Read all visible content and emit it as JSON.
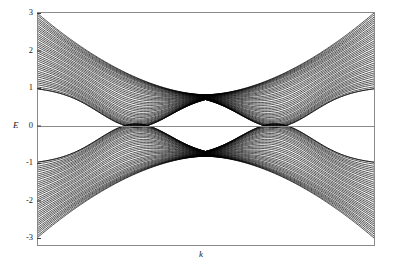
{
  "figure": {
    "background_color": "#ffffff",
    "frame_color": "#8a8a8a",
    "curve_color": "#000000",
    "width": 393,
    "height": 275
  },
  "axes": {
    "x_label": "k",
    "y_label": "E",
    "y_ticks": [
      "3",
      "2",
      "1",
      "0",
      "-1",
      "-2",
      "-3"
    ],
    "x_ticks": []
  },
  "chart_data": {
    "type": "line",
    "title": "",
    "xlabel": "k",
    "ylabel": "E",
    "xlim": [
      -1,
      1
    ],
    "ylim": [
      -3,
      3
    ],
    "grid": false,
    "legend_position": "none",
    "n_subbands": 40,
    "crossing_points": [
      {
        "k": 0.0,
        "E": 0.82
      },
      {
        "k": 0.0,
        "E": -0.82
      }
    ],
    "band_edges": {
      "upper_manifold_top_at_edge": 3.0,
      "upper_manifold_bottom_at_edge": 1.0,
      "upper_manifold_min": 0.02,
      "lower_manifold_bottom_at_edge": -3.0,
      "lower_manifold_top_at_edge": -1.0,
      "lower_manifold_max": -0.02
    },
    "series": [
      {
        "name": "subband-1",
        "E_edge": 3.0,
        "E_center": 0.82
      },
      {
        "name": "subband-2",
        "E_edge": 2.95,
        "E_center": 0.82
      },
      {
        "name": "subband-3",
        "E_edge": 2.89,
        "E_center": 0.82
      },
      {
        "name": "subband-4",
        "E_edge": 2.84,
        "E_center": 0.82
      },
      {
        "name": "subband-5",
        "E_edge": 2.79,
        "E_center": 0.82
      },
      {
        "name": "subband-6",
        "E_edge": 2.74,
        "E_center": 0.82
      },
      {
        "name": "subband-7",
        "E_edge": 2.68,
        "E_center": 0.82
      },
      {
        "name": "subband-8",
        "E_edge": 2.63,
        "E_center": 0.82
      },
      {
        "name": "subband-9",
        "E_edge": 2.58,
        "E_center": 0.82
      },
      {
        "name": "subband-10",
        "E_edge": 2.53,
        "E_center": 0.82
      },
      {
        "name": "subband-11",
        "E_edge": 2.47,
        "E_center": 0.82
      },
      {
        "name": "subband-12",
        "E_edge": 2.42,
        "E_center": 0.82
      },
      {
        "name": "subband-13",
        "E_edge": 2.37,
        "E_center": 0.82
      },
      {
        "name": "subband-14",
        "E_edge": 2.32,
        "E_center": 0.82
      },
      {
        "name": "subband-15",
        "E_edge": 2.26,
        "E_center": 0.82
      },
      {
        "name": "subband-16",
        "E_edge": 2.21,
        "E_center": 0.82
      },
      {
        "name": "subband-17",
        "E_edge": 2.16,
        "E_center": 0.82
      },
      {
        "name": "subband-18",
        "E_edge": 2.11,
        "E_center": 0.82
      },
      {
        "name": "subband-19",
        "E_edge": 2.05,
        "E_center": 0.82
      },
      {
        "name": "subband-20",
        "E_edge": 2.0,
        "E_center": 0.82
      },
      {
        "name": "subband-21",
        "E_edge": 1.95,
        "E_center": 0.82
      },
      {
        "name": "subband-22",
        "E_edge": 1.89,
        "E_center": 0.82
      },
      {
        "name": "subband-23",
        "E_edge": 1.84,
        "E_center": 0.82
      },
      {
        "name": "subband-24",
        "E_edge": 1.79,
        "E_center": 0.82
      },
      {
        "name": "subband-25",
        "E_edge": 1.74,
        "E_center": 0.82
      },
      {
        "name": "subband-26",
        "E_edge": 1.68,
        "E_center": 0.82
      },
      {
        "name": "subband-27",
        "E_edge": 1.63,
        "E_center": 0.82
      },
      {
        "name": "subband-28",
        "E_edge": 1.58,
        "E_center": 0.82
      },
      {
        "name": "subband-29",
        "E_edge": 1.53,
        "E_center": 0.82
      },
      {
        "name": "subband-30",
        "E_edge": 1.47,
        "E_center": 0.82
      },
      {
        "name": "subband-31",
        "E_edge": 1.42,
        "E_center": 0.82
      },
      {
        "name": "subband-32",
        "E_edge": 1.37,
        "E_center": 0.82
      },
      {
        "name": "subband-33",
        "E_edge": 1.32,
        "E_center": 0.82
      },
      {
        "name": "subband-34",
        "E_edge": 1.26,
        "E_center": 0.82
      },
      {
        "name": "subband-35",
        "E_edge": 1.21,
        "E_center": 0.82
      },
      {
        "name": "subband-36",
        "E_edge": 1.16,
        "E_center": 0.82
      },
      {
        "name": "subband-37",
        "E_edge": 1.11,
        "E_center": 0.82
      },
      {
        "name": "subband-38",
        "E_edge": 1.05,
        "E_center": 0.82
      },
      {
        "name": "subband-39",
        "E_edge": 1.0,
        "E_center": 0.82
      },
      {
        "name": "subband-40",
        "E_edge": 1.0,
        "E_center": 0.82
      }
    ]
  },
  "geometry": {
    "plot_left": 37,
    "plot_right": 374,
    "plot_top": 12,
    "plot_bottom": 245,
    "e_top": 13,
    "e_bottom": 238,
    "zero_line_y": 126,
    "crossing_x": 205
  }
}
